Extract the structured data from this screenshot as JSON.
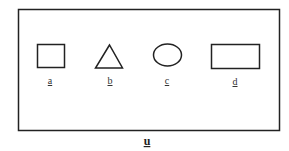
{
  "diagram": {
    "caption": "u",
    "stroke_color": "#222222",
    "shapes": [
      {
        "id": "a",
        "type": "square",
        "label": "a"
      },
      {
        "id": "b",
        "type": "triangle",
        "label": "b"
      },
      {
        "id": "c",
        "type": "ellipse",
        "label": "c"
      },
      {
        "id": "d",
        "type": "rectangle",
        "label": "d"
      }
    ]
  }
}
